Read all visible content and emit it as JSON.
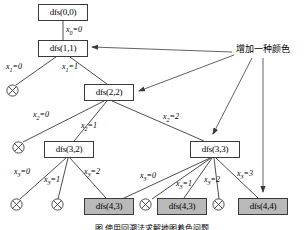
{
  "figure": {
    "annotation": "增加一种颜色",
    "caption": "图 使用回溯法求解地图着色问题",
    "colors": {
      "stroke": "#3a3a3a",
      "fill_gray": "#b9b9b9",
      "background": "#ffffff",
      "text": "#000000"
    }
  },
  "nodes": [
    {
      "id": "n00",
      "label": "dfs(0,0)",
      "x": 38,
      "y": 4,
      "w": 50,
      "h": 17,
      "filled": false
    },
    {
      "id": "n11",
      "label": "dfs(1,1)",
      "x": 38,
      "y": 40,
      "w": 50,
      "h": 17,
      "filled": false
    },
    {
      "id": "n22",
      "label": "dfs(2,2)",
      "x": 84,
      "y": 84,
      "w": 50,
      "h": 17,
      "filled": false
    },
    {
      "id": "n32",
      "label": "dfs(3,2)",
      "x": 44,
      "y": 141,
      "w": 50,
      "h": 17,
      "filled": false
    },
    {
      "id": "n33",
      "label": "dfs(3,3)",
      "x": 190,
      "y": 141,
      "w": 50,
      "h": 17,
      "filled": false
    },
    {
      "id": "n43a",
      "label": "dfs(4,3)",
      "x": 84,
      "y": 198,
      "w": 50,
      "h": 17,
      "filled": true
    },
    {
      "id": "n43b",
      "label": "dfs(4,3)",
      "x": 157,
      "y": 198,
      "w": 50,
      "h": 17,
      "filled": true
    },
    {
      "id": "n44",
      "label": "dfs(4,4)",
      "x": 238,
      "y": 198,
      "w": 50,
      "h": 17,
      "filled": true
    }
  ],
  "leaves": [
    {
      "id": "f1",
      "x": 6,
      "y": 84
    },
    {
      "id": "f2",
      "x": 12,
      "y": 141
    },
    {
      "id": "f3",
      "x": 10,
      "y": 198
    },
    {
      "id": "f4",
      "x": 51,
      "y": 198
    },
    {
      "id": "f5",
      "x": 139,
      "y": 198
    },
    {
      "id": "f6",
      "x": 212,
      "y": 198
    }
  ],
  "edge_labels": [
    {
      "id": "e0",
      "var": "x",
      "sub": "0",
      "val": "0",
      "x": 66,
      "y": 26
    },
    {
      "id": "e1a",
      "var": "x",
      "sub": "1",
      "val": "0",
      "x": 6,
      "y": 63
    },
    {
      "id": "e1b",
      "var": "x",
      "sub": "1",
      "val": "1",
      "x": 62,
      "y": 63
    },
    {
      "id": "e2a",
      "var": "x",
      "sub": "2",
      "val": "0",
      "x": 33,
      "y": 111
    },
    {
      "id": "e2b",
      "var": "x",
      "sub": "2",
      "val": "1",
      "x": 81,
      "y": 122
    },
    {
      "id": "e2c",
      "var": "x",
      "sub": "2",
      "val": "2",
      "x": 163,
      "y": 113
    },
    {
      "id": "e3a",
      "var": "x",
      "sub": "3",
      "val": "0",
      "x": 14,
      "y": 168
    },
    {
      "id": "e3b",
      "var": "x",
      "sub": "3",
      "val": "1",
      "x": 44,
      "y": 176
    },
    {
      "id": "e3c",
      "var": "x",
      "sub": "3",
      "val": "2",
      "x": 84,
      "y": 168
    },
    {
      "id": "e3d",
      "var": "x",
      "sub": "3",
      "val": "0",
      "x": 140,
      "y": 172
    },
    {
      "id": "e3e",
      "var": "x",
      "sub": "3",
      "val": "1",
      "x": 176,
      "y": 180
    },
    {
      "id": "e3f",
      "var": "x",
      "sub": "3",
      "val": "2",
      "x": 204,
      "y": 176
    },
    {
      "id": "e3g",
      "var": "x",
      "sub": "3",
      "val": "3",
      "x": 237,
      "y": 170
    }
  ],
  "annotation": {
    "text": "增加一种颜色",
    "x": 236,
    "y": 51
  }
}
